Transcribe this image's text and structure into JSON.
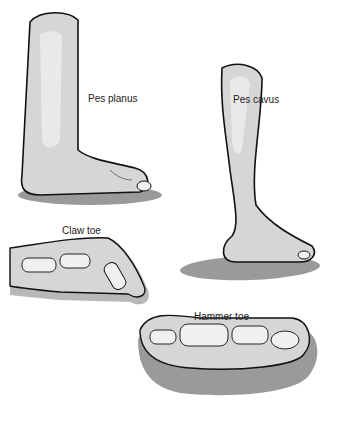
{
  "figure": {
    "panels": [
      {
        "id": "pes-planus",
        "label": "Pes planus"
      },
      {
        "id": "pes-cavus",
        "label": "Pes cavus"
      },
      {
        "id": "claw-toe",
        "label": "Claw toe"
      },
      {
        "id": "hammer-toe",
        "label": "Hammer toe"
      }
    ],
    "colors": {
      "skin": "#d6d6d6",
      "skin_highlight": "#eeeeee",
      "shadow": "#9a9a9a",
      "bone": "#f0f0f0",
      "outline": "#111111"
    }
  }
}
